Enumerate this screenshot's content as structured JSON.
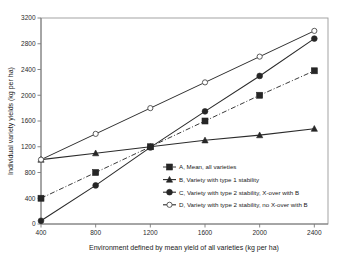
{
  "chart_data": {
    "type": "line",
    "title": "",
    "xlabel": "Environment defined by mean yield of all varieties (kg per ha)",
    "ylabel": "Individual variety yields (kg per ha)",
    "x": [
      400,
      800,
      1200,
      1600,
      2000,
      2400
    ],
    "xlim": [
      400,
      2500
    ],
    "ylim": [
      0,
      3200
    ],
    "xticks": [
      "400",
      "800",
      "1200",
      "1600",
      "2000",
      "2400"
    ],
    "yticks": [
      "0",
      "400",
      "800",
      "1200",
      "1600",
      "2000",
      "2400",
      "2800",
      "3200"
    ],
    "grid": false,
    "legend_position": "center-right-inside",
    "series": [
      {
        "name": "A, Mean, all varieties",
        "legend_label": "A, Mean, all varieties",
        "marker": "filled-square",
        "linestyle": "dash-dot",
        "color": "#2b2b2b",
        "values": [
          400,
          800,
          1200,
          1600,
          2000,
          2380
        ]
      },
      {
        "name": "B, Variety with type 1 stability",
        "legend_label": "B, Variety with type 1 stability",
        "marker": "filled-triangle",
        "linestyle": "solid",
        "color": "#2b2b2b",
        "values": [
          1000,
          1100,
          1200,
          1300,
          1380,
          1480
        ]
      },
      {
        "name": "C, Variety with type 2 stability, X-over with B",
        "legend_label": "C, Variety with type 2 stability, X-over with B",
        "marker": "filled-circle",
        "linestyle": "solid",
        "color": "#2b2b2b",
        "values": [
          50,
          600,
          1190,
          1750,
          2300,
          2880
        ]
      },
      {
        "name": "D, Variety with type 2 stability, no X-over with B",
        "legend_label": "D, Variety with type 2 stability, no X-over with B",
        "marker": "open-circle",
        "linestyle": "solid",
        "color": "#4a4a4a",
        "values": [
          1000,
          1400,
          1800,
          2200,
          2600,
          3000
        ]
      }
    ]
  },
  "axes": {
    "x_title": "Environment defined by mean yield of all varieties (kg per ha)",
    "y_title": "Individual variety yields (kg per ha)"
  }
}
